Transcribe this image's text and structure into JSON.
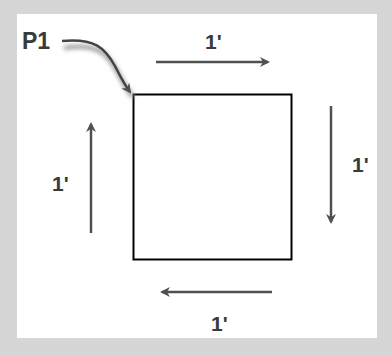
{
  "diagram": {
    "start_point_label": "P1",
    "edges": [
      {
        "side": "top",
        "direction": "right",
        "length_label": "1'"
      },
      {
        "side": "right",
        "direction": "down",
        "length_label": "1'"
      },
      {
        "side": "bottom",
        "direction": "left",
        "length_label": "1'"
      },
      {
        "side": "left",
        "direction": "up",
        "length_label": "1'"
      }
    ],
    "colors": {
      "frame": "#d6d6d6",
      "square_stroke": "#000000",
      "arrow": "#555555",
      "text": "#3a3a3a"
    }
  }
}
